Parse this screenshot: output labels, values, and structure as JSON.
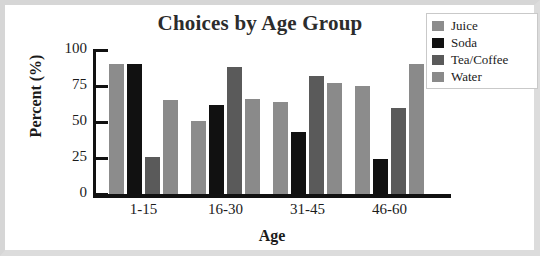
{
  "chart_data": {
    "type": "bar",
    "title": "Choices by Age Group",
    "xlabel": "Age",
    "ylabel": "Percent (%)",
    "categories": [
      "1-15",
      "16-30",
      "31-45",
      "46-60"
    ],
    "series": [
      {
        "name": "Juice",
        "color": "#8c8c8c",
        "values": [
          90,
          51,
          64,
          75
        ]
      },
      {
        "name": "Soda",
        "color": "#111111",
        "values": [
          90,
          62,
          43,
          24
        ]
      },
      {
        "name": "Tea/Coffee",
        "color": "#5a5a5a",
        "values": [
          26,
          88,
          82,
          60
        ]
      },
      {
        "name": "Water",
        "color": "#8a8a8a",
        "values": [
          65,
          66,
          77,
          90
        ]
      }
    ],
    "ylim": [
      0,
      100
    ],
    "yticks": [
      0,
      25,
      50,
      75,
      100
    ],
    "ytick_labels": [
      "0",
      "25",
      "50",
      "75",
      "100"
    ],
    "grid": false,
    "legend_position": "top-right"
  },
  "legend": {
    "items": [
      {
        "label": "Juice"
      },
      {
        "label": "Soda"
      },
      {
        "label": "Tea/Coffee"
      },
      {
        "label": "Water"
      }
    ]
  }
}
